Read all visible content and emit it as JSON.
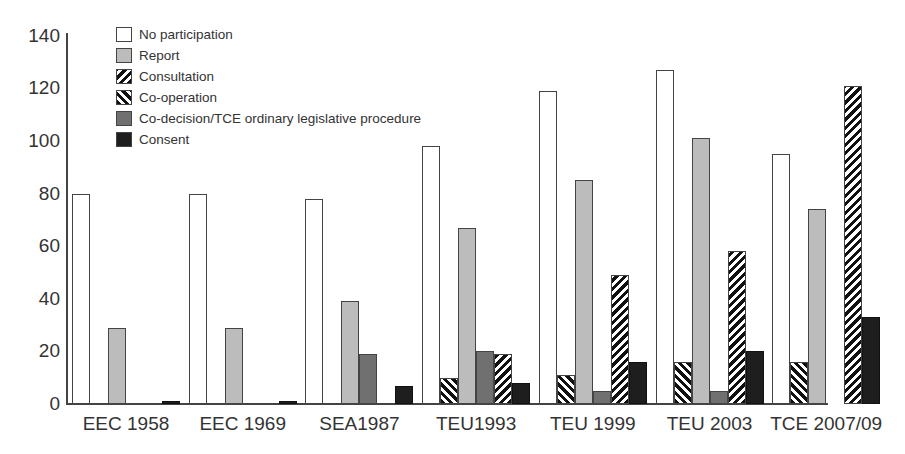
{
  "chart_data": {
    "type": "bar",
    "title": "",
    "xlabel": "",
    "ylabel": "",
    "ylim": [
      0,
      140
    ],
    "yticks": [
      0,
      20,
      40,
      60,
      80,
      100,
      120,
      140
    ],
    "grid": false,
    "legend_position": "top-left (inside plot)",
    "categories": [
      "EEC 1958",
      "EEC 1969",
      "SEA1987",
      "TEU1993",
      "TEU 1999",
      "TEU 2003",
      "TCE 2007/09"
    ],
    "series": [
      {
        "name": "No participation",
        "pattern": "white",
        "values": [
          80,
          80,
          78,
          98,
          119,
          127,
          95
        ]
      },
      {
        "name": "Co-operation",
        "pattern": "hatch-back",
        "values": [
          0,
          0,
          0,
          10,
          11,
          16,
          16
        ]
      },
      {
        "name": "Report",
        "pattern": "light-gray",
        "values": [
          29,
          29,
          39,
          67,
          85,
          101,
          74
        ]
      },
      {
        "name": "Co-decision/TCE ordinary legislative procedure",
        "pattern": "dark-gray",
        "values": [
          0,
          0,
          19,
          20,
          5,
          5,
          0
        ]
      },
      {
        "name": "Consultation",
        "pattern": "hatch-forward",
        "values": [
          0,
          0,
          0,
          19,
          49,
          58,
          121
        ]
      },
      {
        "name": "Consent",
        "pattern": "black",
        "values": [
          1,
          1,
          7,
          8,
          16,
          20,
          33
        ]
      }
    ],
    "legend_order": [
      "No participation",
      "Report",
      "Consultation",
      "Co-operation",
      "Co-decision/TCE ordinary legislative procedure",
      "Consent"
    ]
  },
  "colors": {
    "no_participation": "#ffffff",
    "report": "#bcbcbc",
    "codecision": "#707070",
    "consent": "#1e1e1e",
    "hatch": "#111111",
    "axis": "#444444"
  }
}
